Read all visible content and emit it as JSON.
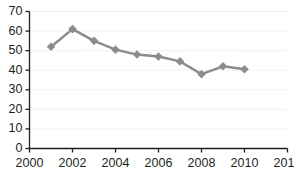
{
  "chart_data": {
    "type": "line",
    "title": "",
    "subtitle": "",
    "xlabel": "",
    "ylabel": "",
    "grid": true,
    "legend": false,
    "legend_position": "none",
    "xlim": [
      2000,
      2012
    ],
    "ylim": [
      0,
      70
    ],
    "x_ticks": [
      2000,
      2002,
      2004,
      2006,
      2008,
      2010,
      2012
    ],
    "x_tick_labels": [
      "2000",
      "2002",
      "2004",
      "2006",
      "2008",
      "2010",
      "2012"
    ],
    "y_ticks": [
      0,
      10,
      20,
      30,
      40,
      50,
      60,
      70
    ],
    "y_tick_labels": [
      "0",
      "10",
      "20",
      "30",
      "40",
      "50",
      "60",
      "70"
    ],
    "x": [
      2001,
      2002,
      2003,
      2004,
      2005,
      2006,
      2007,
      2008,
      2009,
      2010
    ],
    "values": [
      52,
      61,
      55,
      50.5,
      48,
      47,
      44.5,
      38,
      42,
      40.5
    ],
    "series": [
      {
        "name": "series-1",
        "x": [
          2001,
          2002,
          2003,
          2004,
          2005,
          2006,
          2007,
          2008,
          2009,
          2010
        ],
        "values": [
          52,
          61,
          55,
          50.5,
          48,
          47,
          44.5,
          38,
          42,
          40.5
        ],
        "color": "#8c8c8c",
        "marker": "diamond"
      }
    ],
    "annotations": []
  },
  "style": {
    "line_color": "#8c8c8c",
    "marker_color": "#8c8c8c",
    "grid_color": "#d9d9d9",
    "axis_color": "#231f20",
    "text_color": "#231f20",
    "background": "#ffffff"
  }
}
